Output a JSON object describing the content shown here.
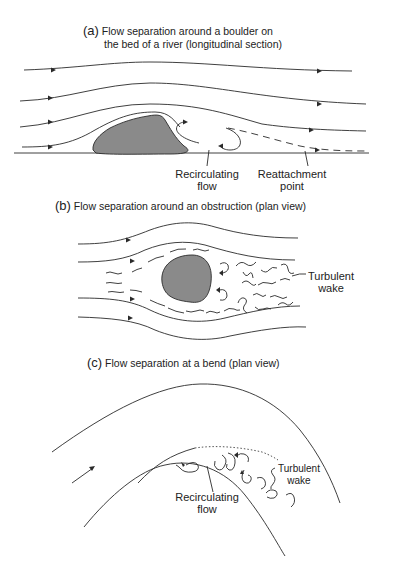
{
  "figure": {
    "panels": [
      {
        "id": "a",
        "tag": "(a)",
        "title_line1": "Flow separation around a boulder on",
        "title_line2": "the bed of a river (longitudinal section)",
        "labels": {
          "recirculating": [
            "Recirculating",
            "flow"
          ],
          "reattachment": [
            "Reattachment",
            "point"
          ]
        }
      },
      {
        "id": "b",
        "tag": "(b)",
        "title": "Flow separation around an obstruction (plan view)",
        "labels": {
          "wake": [
            "Turbulent",
            "wake"
          ]
        }
      },
      {
        "id": "c",
        "tag": "(c)",
        "title": "Flow separation at a bend (plan view)",
        "labels": {
          "wake": [
            "Turbulent",
            "wake"
          ],
          "recirculating": [
            "Recirculating",
            "flow"
          ]
        }
      }
    ],
    "colors": {
      "line": "#2a2a2a",
      "obstacle_fill": "#8a8a8a",
      "background": "#ffffff"
    }
  }
}
